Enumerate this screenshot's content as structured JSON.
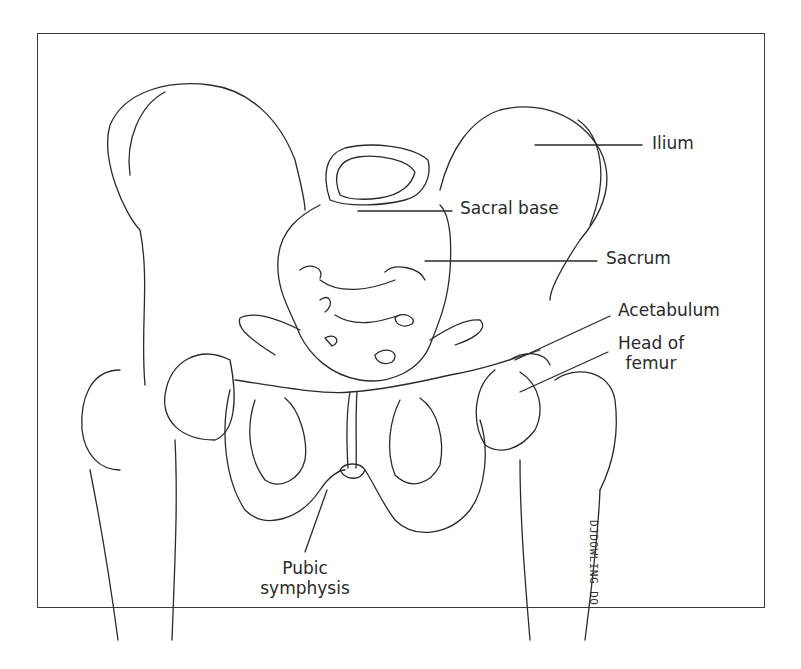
{
  "figure": {
    "type": "anatomical line drawing",
    "line_color": "#2a2a2a",
    "background": "#ffffff"
  },
  "labels": {
    "ilium": "Ilium",
    "sacral_base": "Sacral base",
    "sacrum": "Sacrum",
    "acetabulum": "Acetabulum",
    "head_of_femur_line1": "Head of",
    "head_of_femur_line2": "femur",
    "pubic_symphysis_line1": "Pubic",
    "pubic_symphysis_line2": "symphysis"
  },
  "signature": "DJDOWLING DO"
}
